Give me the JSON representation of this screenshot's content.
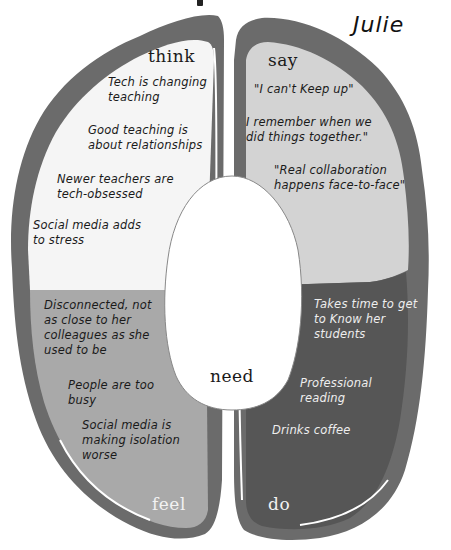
{
  "persona": {
    "name": "Julie"
  },
  "colors": {
    "outline": "#6b6b6b",
    "think": "#f5f5f5",
    "say": "#d3d3d3",
    "feel": "#a9a9a9",
    "do": "#565656",
    "need": "#ffffff",
    "highlight": "#ffffff"
  },
  "quadrants": {
    "think": {
      "label": "think",
      "notes": [
        "Tech is changing\nteaching",
        "Good teaching is\nabout relationships",
        "Newer teachers are\ntech-obsessed",
        "Social media adds\nto stress"
      ]
    },
    "say": {
      "label": "say",
      "notes": [
        "\"I can't Keep up\"",
        "I remember when we\ndid things together.\"",
        "\"Real collaboration\nhappens face-to-face\""
      ]
    },
    "feel": {
      "label": "feel",
      "notes": [
        "Disconnected, not\nas close to her\ncolleagues as she\nused to be",
        "People are too\nbusy",
        "Social media is\nmaking isolation\nworse"
      ]
    },
    "do": {
      "label": "do",
      "notes": [
        "Takes time to get\nto Know her\nstudents",
        "Professional\nreading",
        "Drinks coffee"
      ]
    },
    "need": {
      "label": "need",
      "notes": []
    }
  }
}
